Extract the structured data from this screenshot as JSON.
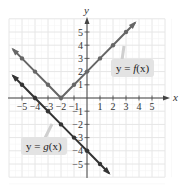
{
  "chart_data": {
    "type": "line",
    "title": "",
    "xlabel": "x",
    "ylabel": "y",
    "xlim": [
      -5.5,
      5.5
    ],
    "ylim": [
      -5.5,
      5.5
    ],
    "grid": true,
    "x_ticks": [
      -5,
      -4,
      -3,
      -2,
      -1,
      1,
      2,
      3,
      4,
      5
    ],
    "y_ticks": [
      -5,
      -4,
      -3,
      -2,
      -1,
      1,
      2,
      3,
      4,
      5
    ],
    "series": [
      {
        "name": "y = f(x)",
        "formula": "f(x) = |x + 2|",
        "color": "#666666",
        "points": [
          [
            -5,
            3
          ],
          [
            -4,
            2
          ],
          [
            -3,
            1
          ],
          [
            -2,
            0
          ],
          [
            -1,
            1
          ],
          [
            0,
            2
          ],
          [
            1,
            3
          ],
          [
            2,
            4
          ],
          [
            3,
            5
          ]
        ]
      },
      {
        "name": "y = g(x)",
        "formula": "g(x) = -x - 4",
        "color": "#333333",
        "points": [
          [
            -5,
            1
          ],
          [
            -4,
            0
          ],
          [
            -3,
            -1
          ],
          [
            -2,
            -2
          ],
          [
            -1,
            -3
          ],
          [
            0,
            -4
          ],
          [
            1,
            -5
          ]
        ]
      }
    ],
    "annotations": [
      {
        "text": "y = f(x)",
        "target_series": 0
      },
      {
        "text": "y = g(x)",
        "target_series": 1
      }
    ]
  },
  "labels": {
    "x_axis": "x",
    "y_axis": "y",
    "f_label_prefix": "y = ",
    "f_label_fn": "f",
    "f_label_arg": "(x)",
    "g_label_prefix": "y = ",
    "g_label_fn": "g",
    "g_label_arg": "(x)"
  }
}
